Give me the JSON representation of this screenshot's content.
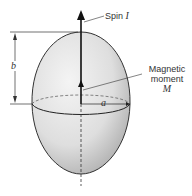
{
  "diagram": {
    "labels": {
      "spin_text": "Spin",
      "spin_symbol": "I",
      "moment_line1": "Magnetic",
      "moment_line2": "moment",
      "moment_symbol": "M",
      "semi_major": "b",
      "semi_minor": "a"
    },
    "colors": {
      "shape_fill_light": "#f2f2f2",
      "shape_fill_dark": "#b8b8b8",
      "line": "#222222"
    }
  }
}
